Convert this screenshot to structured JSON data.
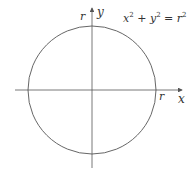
{
  "diagram": {
    "equation": {
      "base_x": "x",
      "plus": "+",
      "base_y": "y",
      "eq": "=",
      "base_r": "r",
      "exp": "2"
    },
    "labels": {
      "x_axis": "x",
      "y_axis": "y",
      "r_top": "r",
      "r_right": "r"
    },
    "colors": {
      "stroke": "#555555",
      "text": "#333333"
    }
  }
}
